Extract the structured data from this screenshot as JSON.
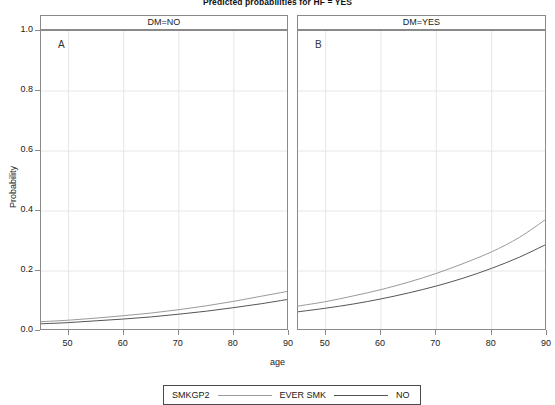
{
  "chart_data": {
    "type": "line",
    "title": "Predicted probabilities for HF = YES",
    "xlabel": "age",
    "ylabel": "Probability",
    "xlim": [
      45,
      90
    ],
    "ylim": [
      0.0,
      1.0
    ],
    "xticks": [
      50,
      60,
      70,
      80,
      90
    ],
    "yticks": [
      "0.0",
      "0.2",
      "0.4",
      "0.6",
      "0.8",
      "1.0"
    ],
    "ytick_values": [
      0.0,
      0.2,
      0.4,
      0.6,
      0.8,
      1.0
    ],
    "grid": true,
    "legend_position": "bottom",
    "legend_title": "SMKGP2",
    "panels": [
      {
        "id": "A",
        "letter": "A",
        "strip_label": "DM=NO",
        "series": [
          {
            "name": "EVER SMK",
            "color": "#9a9a9a",
            "x": [
              45,
              50,
              55,
              60,
              65,
              70,
              75,
              80,
              85,
              90
            ],
            "values": [
              0.031,
              0.036,
              0.043,
              0.051,
              0.06,
              0.071,
              0.084,
              0.099,
              0.116,
              0.133
            ]
          },
          {
            "name": "NO",
            "color": "#555555",
            "x": [
              45,
              50,
              55,
              60,
              65,
              70,
              75,
              80,
              85,
              90
            ],
            "values": [
              0.024,
              0.028,
              0.034,
              0.04,
              0.047,
              0.056,
              0.066,
              0.078,
              0.091,
              0.106
            ]
          }
        ]
      },
      {
        "id": "B",
        "letter": "B",
        "strip_label": "DM=YES",
        "series": [
          {
            "name": "EVER SMK",
            "color": "#9a9a9a",
            "x": [
              45,
              50,
              55,
              60,
              65,
              70,
              75,
              80,
              85,
              90
            ],
            "values": [
              0.083,
              0.098,
              0.117,
              0.138,
              0.163,
              0.192,
              0.226,
              0.264,
              0.312,
              0.375
            ]
          },
          {
            "name": "NO",
            "color": "#555555",
            "x": [
              45,
              50,
              55,
              60,
              65,
              70,
              75,
              80,
              85,
              90
            ],
            "values": [
              0.064,
              0.076,
              0.09,
              0.107,
              0.127,
              0.15,
              0.177,
              0.209,
              0.246,
              0.29
            ]
          }
        ]
      }
    ],
    "legend_entries": [
      {
        "label": "EVER SMK",
        "color": "#9a9a9a"
      },
      {
        "label": "NO",
        "color": "#555555"
      }
    ]
  },
  "colors": {
    "axis": "#8a8a8a",
    "grid": "#e6e6e6",
    "text": "#1a1a1a",
    "legend_border": "#4a4a4a"
  }
}
